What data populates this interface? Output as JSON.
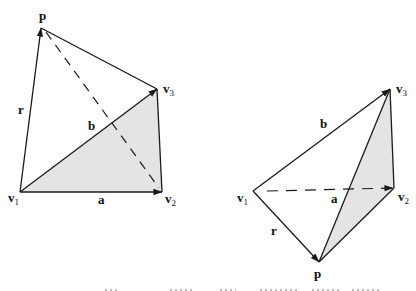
{
  "colors": {
    "stroke": "#1a1a1a",
    "shade": "#e4e4e4",
    "background": "#ffffff"
  },
  "figures": [
    {
      "id": "left",
      "shaded_face": [
        "v1",
        "v2",
        "v3"
      ],
      "dashed_edge": [
        "p",
        "v2"
      ],
      "vectors": [
        {
          "name": "r",
          "from": "v1",
          "to": "p"
        },
        {
          "name": "a",
          "from": "v1",
          "to": "v2"
        },
        {
          "name": "b",
          "from": "v1",
          "to": "v3"
        }
      ],
      "labels": {
        "p": "p",
        "v1": "v",
        "v1_sub": "1",
        "v2": "v",
        "v2_sub": "2",
        "v3": "v",
        "v3_sub": "3",
        "r": "r",
        "a": "a",
        "b": "b"
      }
    },
    {
      "id": "right",
      "shaded_face": [
        "p",
        "v2",
        "v3"
      ],
      "dashed_edge": [
        "v1",
        "v2"
      ],
      "vectors": [
        {
          "name": "r",
          "from": "v1",
          "to": "p"
        },
        {
          "name": "a",
          "from": "v1",
          "to": "v2"
        },
        {
          "name": "b",
          "from": "v1",
          "to": "v3"
        }
      ],
      "labels": {
        "p": "p",
        "v1": "v",
        "v1_sub": "1",
        "v2": "v",
        "v2_sub": "2",
        "v3": "v",
        "v3_sub": "3",
        "r": "r",
        "a": "a",
        "b": "b"
      }
    }
  ]
}
